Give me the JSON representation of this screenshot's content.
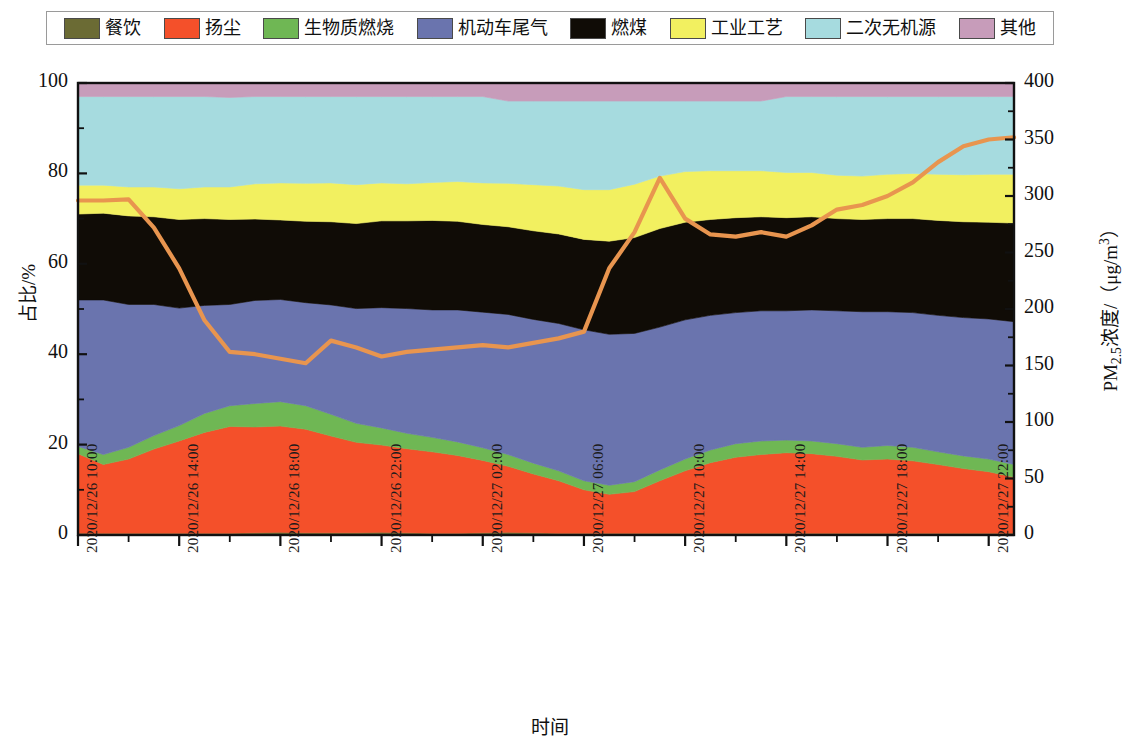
{
  "legend": {
    "items": [
      {
        "label": "餐饮",
        "key": "catering",
        "color": "#6b6b34"
      },
      {
        "label": "扬尘",
        "key": "fugitive-dust",
        "color": "#f4502a"
      },
      {
        "label": "生物质燃烧",
        "key": "biomass-burning",
        "color": "#6fb754"
      },
      {
        "label": "机动车尾气",
        "key": "vehicle-exhaust",
        "color": "#6a74ae"
      },
      {
        "label": "燃煤",
        "key": "coal-combustion",
        "color": "#100c06"
      },
      {
        "label": "工业工艺",
        "key": "industrial-process",
        "color": "#f2f060"
      },
      {
        "label": "二次无机源",
        "key": "secondary-inorganic",
        "color": "#a6dbdf"
      },
      {
        "label": "其他",
        "key": "other",
        "color": "#c79cba"
      }
    ]
  },
  "chart_data": {
    "type": "area",
    "title": "",
    "xlabel": "时间",
    "ylabel": "占比/%",
    "ylabel_right": "PM2.5浓度/(μg/m³)",
    "ylim": [
      0,
      100
    ],
    "ylim_right": [
      0,
      400
    ],
    "yticks": [
      0,
      20,
      40,
      60,
      80,
      100
    ],
    "yticks_right": [
      0,
      50,
      100,
      150,
      200,
      250,
      300,
      350,
      400
    ],
    "grid": false,
    "legend_position": "top",
    "x_tick_labels": [
      "2020/12/26 10:00",
      "2020/12/26 14:00",
      "2020/12/26 18:00",
      "2020/12/26 22:00",
      "2020/12/27 02:00",
      "2020/12/27 06:00",
      "2020/12/27 10:00",
      "2020/12/27 14:00",
      "2020/12/27 18:00",
      "2020/12/27 22:00"
    ],
    "x": [
      "2020/12/26 10:00",
      "2020/12/26 11:00",
      "2020/12/26 12:00",
      "2020/12/26 13:00",
      "2020/12/26 14:00",
      "2020/12/26 15:00",
      "2020/12/26 16:00",
      "2020/12/26 17:00",
      "2020/12/26 18:00",
      "2020/12/26 19:00",
      "2020/12/26 20:00",
      "2020/12/26 21:00",
      "2020/12/26 22:00",
      "2020/12/26 23:00",
      "2020/12/27 00:00",
      "2020/12/27 01:00",
      "2020/12/27 02:00",
      "2020/12/27 03:00",
      "2020/12/27 04:00",
      "2020/12/27 05:00",
      "2020/12/27 06:00",
      "2020/12/27 07:00",
      "2020/12/27 08:00",
      "2020/12/27 09:00",
      "2020/12/27 10:00",
      "2020/12/27 11:00",
      "2020/12/27 12:00",
      "2020/12/27 13:00",
      "2020/12/27 14:00",
      "2020/12/27 15:00",
      "2020/12/27 16:00",
      "2020/12/27 17:00",
      "2020/12/27 18:00",
      "2020/12/27 19:00",
      "2020/12/27 20:00",
      "2020/12/27 21:00",
      "2020/12/27 22:00",
      "2020/12/27 23:00"
    ],
    "series": [
      {
        "name": "餐饮",
        "color": "#6b6b34",
        "values": [
          0.4,
          0.4,
          0.4,
          0.4,
          0.4,
          0.4,
          0.4,
          0.5,
          0.6,
          0.5,
          0.5,
          0.5,
          0.6,
          0.5,
          0.4,
          0.4,
          0.5,
          0.6,
          0.5,
          0.4,
          0.4,
          0.4,
          0.4,
          0.4,
          0.4,
          0.4,
          0.4,
          0.4,
          0.4,
          0.4,
          0.4,
          0.4,
          0.4,
          0.4,
          0.4,
          0.4,
          0.4,
          0.4
        ]
      },
      {
        "name": "扬尘",
        "color": "#f4502a",
        "values": [
          17.6,
          15.2,
          16.4,
          18.6,
          20.4,
          22.3,
          23.6,
          23.4,
          23.5,
          22.9,
          21.4,
          20.0,
          19.3,
          18.6,
          18.0,
          17.2,
          16.0,
          14.6,
          13.0,
          11.6,
          9.6,
          8.6,
          9.2,
          11.6,
          13.8,
          15.6,
          16.8,
          17.4,
          17.8,
          17.6,
          17.0,
          16.2,
          16.4,
          16.0,
          15.2,
          14.3,
          13.6,
          12.4
        ]
      },
      {
        "name": "生物质燃烧",
        "color": "#6fb754",
        "values": [
          1.6,
          2.2,
          2.6,
          3.0,
          3.4,
          4.2,
          4.6,
          5.2,
          5.4,
          5.2,
          4.8,
          4.2,
          3.8,
          3.4,
          3.2,
          3.0,
          2.8,
          2.6,
          2.4,
          2.2,
          2.0,
          2.0,
          2.2,
          2.4,
          2.6,
          2.8,
          3.0,
          3.0,
          2.8,
          2.8,
          2.8,
          2.8,
          3.0,
          3.0,
          2.8,
          2.8,
          2.8,
          2.8
        ]
      },
      {
        "name": "机动车尾气",
        "color": "#6a74ae",
        "values": [
          32.4,
          34.2,
          31.6,
          29.0,
          26.0,
          23.9,
          22.4,
          22.8,
          22.6,
          22.8,
          24.2,
          25.4,
          26.6,
          27.6,
          28.2,
          29.2,
          30.0,
          31.0,
          31.8,
          32.6,
          33.4,
          33.4,
          32.8,
          31.6,
          30.8,
          29.8,
          29.0,
          28.8,
          28.6,
          29.0,
          29.4,
          30.0,
          29.6,
          29.8,
          30.2,
          30.6,
          31.0,
          31.6
        ]
      },
      {
        "name": "燃煤",
        "color": "#100c06",
        "values": [
          19.0,
          19.2,
          19.6,
          19.4,
          19.6,
          19.2,
          18.8,
          18.0,
          17.6,
          18.0,
          18.4,
          18.8,
          19.2,
          19.4,
          19.8,
          19.6,
          19.4,
          19.4,
          19.6,
          19.8,
          20.0,
          20.6,
          21.2,
          21.8,
          21.6,
          21.2,
          21.0,
          20.8,
          20.6,
          20.6,
          20.4,
          20.4,
          20.6,
          20.8,
          21.0,
          21.2,
          21.4,
          21.8
        ]
      },
      {
        "name": "工业工艺",
        "color": "#f2f060",
        "values": [
          6.4,
          6.2,
          6.4,
          6.6,
          6.8,
          7.0,
          7.2,
          7.8,
          8.2,
          8.4,
          8.6,
          8.6,
          8.4,
          8.2,
          8.4,
          8.8,
          9.2,
          9.6,
          10.2,
          10.6,
          11.0,
          11.4,
          11.8,
          11.6,
          11.2,
          10.8,
          10.4,
          10.2,
          10.0,
          9.8,
          9.6,
          9.6,
          9.8,
          10.0,
          10.2,
          10.4,
          10.6,
          10.8
        ]
      },
      {
        "name": "二次无机源",
        "color": "#a6dbdf",
        "values": [
          19.6,
          19.6,
          20.0,
          20.0,
          20.4,
          20.0,
          19.8,
          19.3,
          19.1,
          19.2,
          19.1,
          19.5,
          19.1,
          19.3,
          19.0,
          18.8,
          19.1,
          18.2,
          18.5,
          18.8,
          19.6,
          19.6,
          18.4,
          16.6,
          15.6,
          15.4,
          15.4,
          15.4,
          16.8,
          16.8,
          17.4,
          17.6,
          17.2,
          17.0,
          17.2,
          17.3,
          17.2,
          17.2
        ]
      },
      {
        "name": "其他",
        "color": "#c79cba",
        "values": [
          3.0,
          3.0,
          3.0,
          3.0,
          3.0,
          3.0,
          3.2,
          3.0,
          3.0,
          3.0,
          3.0,
          3.0,
          3.0,
          3.0,
          3.0,
          3.0,
          3.0,
          4.0,
          4.0,
          4.0,
          4.0,
          4.0,
          4.0,
          4.0,
          4.0,
          4.0,
          4.0,
          4.0,
          3.0,
          3.0,
          3.0,
          3.0,
          3.0,
          3.0,
          3.0,
          3.0,
          3.0,
          3.0
        ]
      }
    ],
    "line_series": {
      "name": "PM2.5浓度",
      "color": "#e8954f",
      "unit": "μg/m³",
      "axis": "right",
      "values": [
        296,
        296,
        297,
        272,
        236,
        190,
        162,
        160,
        156,
        152,
        172,
        166,
        158,
        162,
        164,
        166,
        168,
        166,
        170,
        174,
        180,
        236,
        268,
        316,
        280,
        266,
        264,
        268,
        264,
        274,
        288,
        292,
        300,
        312,
        330,
        344,
        350,
        352
      ]
    }
  }
}
